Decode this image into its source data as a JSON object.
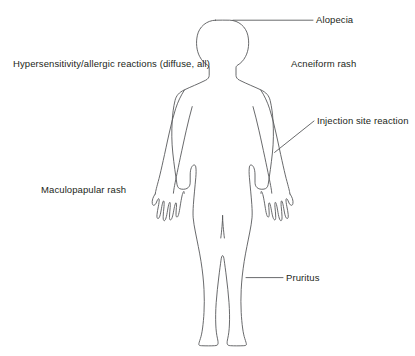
{
  "diagram": {
    "figure_name": "human-body-outline-anterior",
    "colors": {
      "background": "#ffffff",
      "outline": "#58595b",
      "leader_line": "#58595b",
      "text": "#231f20"
    },
    "annotations": [
      {
        "id": "alopecia",
        "label": "Alopecia",
        "target": "scalp",
        "leader": "horizontal",
        "has_leader_line": true
      },
      {
        "id": "hypersensitivity",
        "label": "Hypersensitivity/allergic reactions (diffuse, all)",
        "target": "whole-body",
        "leader": "none",
        "has_leader_line": false
      },
      {
        "id": "acneiform",
        "label": "Acneiform rash",
        "target": "upper-body",
        "leader": "none",
        "has_leader_line": false
      },
      {
        "id": "injection-site",
        "label": "Injection site reaction",
        "target": "left-upper-arm",
        "leader": "diagonal",
        "has_leader_line": true
      },
      {
        "id": "maculopapular",
        "label": "Maculopapular rash",
        "target": "trunk-and-limbs",
        "leader": "none",
        "has_leader_line": false
      },
      {
        "id": "pruritus",
        "label": "Pruritus",
        "target": "left-thigh",
        "leader": "horizontal",
        "has_leader_line": true
      }
    ]
  }
}
